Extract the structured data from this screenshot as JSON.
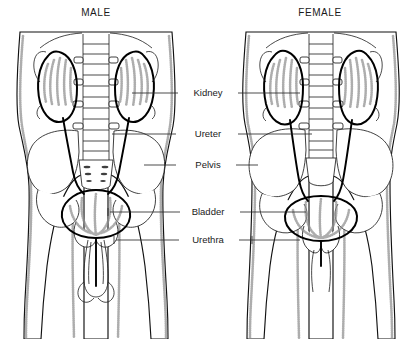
{
  "diagram": {
    "title_male": "MALE",
    "title_female": "FEMALE",
    "colors": {
      "background": "#ffffff",
      "outline": "#111111",
      "organ_outline": "#000000",
      "text": "#1a1a1a",
      "leader_line": "#2b2b2b",
      "stipple": "#8e8e8e"
    }
  },
  "labels": [
    {
      "id": "kidney",
      "text": "Kidney",
      "y": 93,
      "cx": 208,
      "left_line_x1": 178,
      "left_line_x2": 132,
      "right_line_x1": 238,
      "right_line_x2": 300
    },
    {
      "id": "ureter",
      "text": "Ureter",
      "y": 134,
      "cx": 208,
      "left_line_x1": 176,
      "left_line_x2": 112,
      "right_line_x1": 238,
      "right_line_x2": 312
    },
    {
      "id": "pelvis",
      "text": "Pelvis",
      "y": 165,
      "cx": 208,
      "left_line_x1": 176,
      "left_line_x2": 144,
      "right_line_x1": 236,
      "right_line_x2": 258
    },
    {
      "id": "bladder",
      "text": "Bladder",
      "y": 212,
      "cx": 208,
      "left_line_x1": 180,
      "left_line_x2": 110,
      "right_line_x1": 240,
      "right_line_x2": 306
    },
    {
      "id": "urethra",
      "text": "Urethra",
      "y": 240,
      "cx": 208,
      "left_line_x1": 179,
      "left_line_x2": 116,
      "right_line_x1": 239,
      "right_line_x2": 300
    }
  ],
  "figures": [
    {
      "id": "male",
      "title": "MALE",
      "title_x": 96,
      "title_y": 16,
      "center_x": 96,
      "kidney_count": 2,
      "bladder_shape": "rounded-dome",
      "urethra_length": "long",
      "organs": [
        "kidney",
        "ureter",
        "pelvis",
        "bladder",
        "urethra"
      ]
    },
    {
      "id": "female",
      "title": "FEMALE",
      "title_x": 320,
      "title_y": 16,
      "center_x": 320,
      "kidney_count": 2,
      "bladder_shape": "wide-flat",
      "urethra_length": "short",
      "organs": [
        "kidney",
        "ureter",
        "pelvis",
        "bladder",
        "urethra"
      ]
    }
  ]
}
